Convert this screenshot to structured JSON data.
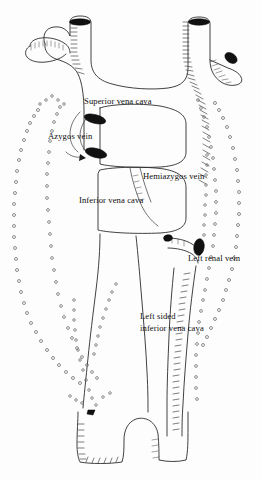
{
  "figure": {
    "background_color": "#ffffff",
    "ink_color": "#2b2b2b",
    "ostium_color": "#111111",
    "node_color": "#6a6a6a",
    "width": 261,
    "height": 480
  },
  "labels": {
    "superior_vena_cava": "Superior vena cava",
    "azygos_vein": "Azygos vein",
    "hemiazygos_vein": "Hemiazygos vein",
    "inferior_vena_cava": "Inferior vena cava",
    "left_renal_vein": "Left renal vein",
    "left_sided_ivc_line1": "Left sided",
    "left_sided_ivc_line2": "inferior vena cava"
  },
  "label_positions": {
    "superior_vena_cava": {
      "x": 84,
      "y": 96
    },
    "azygos_vein": {
      "x": 48,
      "y": 130
    },
    "hemiazygos_vein": {
      "x": 143,
      "y": 170
    },
    "inferior_vena_cava": {
      "x": 79,
      "y": 194
    },
    "left_renal_vein": {
      "x": 188,
      "y": 252
    },
    "left_sided_ivc": {
      "x": 139,
      "y": 310
    }
  },
  "structures": [
    {
      "name": "superior-vena-cava",
      "label": "Superior vena cava",
      "kind": "vein"
    },
    {
      "name": "azygos-vein",
      "label": "Azygos vein",
      "kind": "vein"
    },
    {
      "name": "hemiazygos-vein",
      "label": "Hemiazygos vein",
      "kind": "vein"
    },
    {
      "name": "inferior-vena-cava",
      "label": "Inferior vena cava",
      "kind": "vein"
    },
    {
      "name": "left-renal-vein",
      "label": "Left renal vein",
      "kind": "vein"
    },
    {
      "name": "left-sided-inferior-vena-cava",
      "label": "Left sided inferior vena cava",
      "kind": "vein"
    }
  ]
}
